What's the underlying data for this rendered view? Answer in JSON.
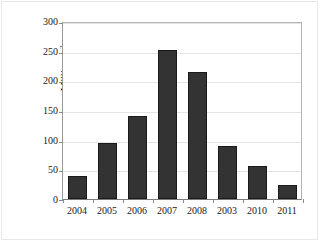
{
  "chart_data": {
    "type": "bar",
    "title": "",
    "subtitle": "",
    "xlabel": "",
    "ylabel": "Million m2",
    "ylabel_base": "Million m",
    "ylabel_superscript": "2",
    "categories": [
      "2004",
      "2005",
      "2006",
      "2007",
      "2008",
      "2003",
      "2010",
      "2011"
    ],
    "values": [
      39,
      96,
      142,
      254,
      216,
      91,
      57,
      24
    ],
    "series": [
      {
        "name": "Area",
        "values": [
          39,
          96,
          142,
          254,
          216,
          91,
          57,
          24
        ]
      }
    ],
    "ylim": [
      0,
      300
    ],
    "ytick_labels": [
      "300",
      "250",
      "200",
      "150",
      "100",
      "50",
      "0"
    ],
    "ytick_values": [
      300,
      250,
      200,
      150,
      100,
      50,
      0
    ],
    "ytick_step": 50,
    "grid": "horizontal",
    "legend": "none",
    "legend_position": "none",
    "annotations": [],
    "bar_color": "#333333",
    "bar_edge_color": "#1a1a1a",
    "gridline_color": "#e4e4e4",
    "axis_color": "#8a8a8a",
    "background_color": "#ffffff"
  }
}
